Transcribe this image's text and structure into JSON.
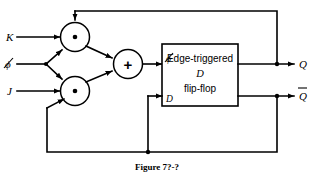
{
  "figure": {
    "caption": "Figure 7?-?"
  },
  "inputs": [
    {
      "id": "k",
      "label": "K"
    },
    {
      "id": "clock",
      "label": "ϕ"
    },
    {
      "id": "j",
      "label": "J"
    }
  ],
  "gates": [
    {
      "id": "and-top",
      "type": "and",
      "glyph": "•"
    },
    {
      "id": "and-bottom",
      "type": "and",
      "glyph": "•"
    },
    {
      "id": "or",
      "type": "or",
      "glyph": "+"
    }
  ],
  "flipflop": {
    "line1": "Edge-triggered",
    "line2": "D",
    "line3": "flip-flop",
    "clock_label": "ϕ",
    "data_label": "D"
  },
  "outputs": [
    {
      "id": "q",
      "label": "Q",
      "bar": false
    },
    {
      "id": "qbar",
      "label": "Q",
      "bar": true
    }
  ],
  "colors": {
    "wire": "#000000",
    "background": "#ffffff",
    "gate_fill": "#ffffff"
  }
}
